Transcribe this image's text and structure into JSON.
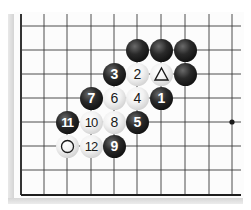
{
  "diagram": {
    "type": "go-board-fragment",
    "grid": {
      "columns_x": [
        21,
        44,
        67,
        91,
        114,
        137,
        161,
        185,
        209,
        232
      ],
      "rows_y": [
        26,
        50,
        74,
        98,
        122,
        146,
        170,
        195
      ],
      "line_color": "#3a3a3a",
      "edge_line_color": "#1e1e1e",
      "left_edge": true,
      "bottom_edge": true
    },
    "star_point": {
      "col": 9,
      "row": 4
    },
    "stones": [
      {
        "color": "black",
        "col": 5,
        "row": 1,
        "label": ""
      },
      {
        "color": "black",
        "col": 6,
        "row": 1,
        "label": ""
      },
      {
        "color": "black",
        "col": 7,
        "row": 1,
        "label": ""
      },
      {
        "color": "black",
        "col": 4,
        "row": 2,
        "label": "3"
      },
      {
        "color": "white",
        "col": 5,
        "row": 2,
        "label": "2"
      },
      {
        "color": "white",
        "col": 6,
        "row": 2,
        "label": "",
        "marker": "triangle"
      },
      {
        "color": "black",
        "col": 7,
        "row": 2,
        "label": ""
      },
      {
        "color": "black",
        "col": 3,
        "row": 3,
        "label": "7"
      },
      {
        "color": "white",
        "col": 4,
        "row": 3,
        "label": "6"
      },
      {
        "color": "white",
        "col": 5,
        "row": 3,
        "label": "4"
      },
      {
        "color": "black",
        "col": 6,
        "row": 3,
        "label": "1"
      },
      {
        "color": "black",
        "col": 2,
        "row": 4,
        "label": "11"
      },
      {
        "color": "white",
        "col": 3,
        "row": 4,
        "label": "10"
      },
      {
        "color": "white",
        "col": 4,
        "row": 4,
        "label": "8"
      },
      {
        "color": "black",
        "col": 5,
        "row": 4,
        "label": "5"
      },
      {
        "color": "white",
        "col": 2,
        "row": 5,
        "label": "",
        "marker": "circle"
      },
      {
        "color": "white",
        "col": 3,
        "row": 5,
        "label": "12"
      },
      {
        "color": "black",
        "col": 4,
        "row": 5,
        "label": "9"
      }
    ]
  }
}
